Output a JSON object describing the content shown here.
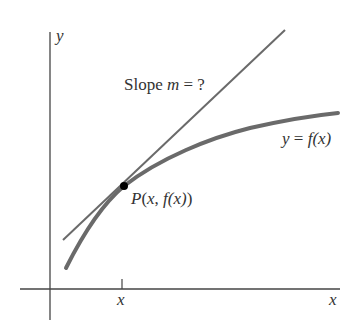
{
  "diagram": {
    "axes": {
      "y_label": "y",
      "x_label": "x"
    },
    "tick": {
      "label": "x"
    },
    "slope_label": {
      "prefix": "Slope ",
      "var": "m",
      "suffix": " = ?"
    },
    "curve_label": {
      "lhs": "y",
      "eq": " = ",
      "func": "f",
      "arg": "(x)"
    },
    "point_label": {
      "name": "P",
      "open": "(",
      "x": "x",
      "sep": ", ",
      "func": "f",
      "arg": "(x)",
      "close": ")"
    },
    "colors": {
      "axes": "#444444",
      "curve": "#6a6a6a",
      "tangent": "#6a6a6a",
      "point": "#000000",
      "text": "#333333"
    }
  }
}
